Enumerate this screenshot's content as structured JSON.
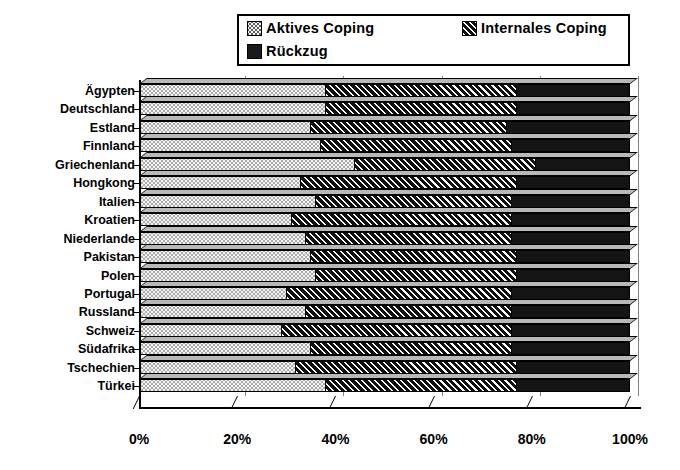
{
  "chart_data": {
    "type": "bar",
    "orientation": "horizontal",
    "stacked": true,
    "normalized_percent": true,
    "title": "",
    "xlabel": "",
    "ylabel": "",
    "xlim": [
      0,
      100
    ],
    "xticks": [
      0,
      20,
      40,
      60,
      80,
      100
    ],
    "xticklabels": [
      "0%",
      "20%",
      "40%",
      "60%",
      "80%",
      "100%"
    ],
    "grid": true,
    "legend_position": "top",
    "categories": [
      "Ägypten",
      "Deutschland",
      "Estland",
      "Finnland",
      "Griechenland",
      "Hongkong",
      "Italien",
      "Kroatien",
      "Niederlande",
      "Pakistan",
      "Polen",
      "Portugal",
      "Russland",
      "Schweiz",
      "Südafrika",
      "Tschechien",
      "Türkei"
    ],
    "series": [
      {
        "name": "Aktives Coping",
        "values": [
          38,
          38,
          35,
          37,
          44,
          33,
          36,
          31,
          34,
          35,
          36,
          30,
          34,
          29,
          35,
          32,
          38
        ]
      },
      {
        "name": "Internales Coping",
        "values": [
          39,
          39,
          40,
          39,
          37,
          44,
          40,
          45,
          42,
          42,
          41,
          46,
          42,
          47,
          41,
          45,
          39
        ]
      },
      {
        "name": "Rückzug",
        "values": [
          23,
          23,
          25,
          24,
          19,
          23,
          24,
          24,
          24,
          23,
          23,
          24,
          24,
          24,
          24,
          23,
          23
        ]
      }
    ]
  },
  "legend": {
    "items": [
      {
        "label": "Aktives Coping",
        "pattern": "dotted"
      },
      {
        "label": "Internales Coping",
        "pattern": "diagonal-hatch"
      },
      {
        "label": "Rückzug",
        "pattern": "solid-black"
      }
    ]
  }
}
